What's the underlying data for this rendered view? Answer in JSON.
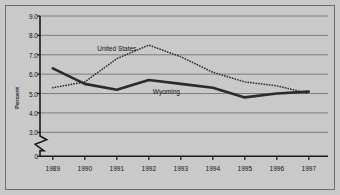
{
  "chart_data": {
    "type": "line",
    "title": "",
    "subtitle": "",
    "xlabel": "",
    "ylabel": "Percent",
    "x": [
      1989,
      1990,
      1991,
      1992,
      1993,
      1994,
      1995,
      1996,
      1997
    ],
    "xtick_labels": [
      "1989",
      "1990",
      "1991",
      "1992",
      "1993",
      "1994",
      "1995",
      "1996",
      "1997"
    ],
    "ytick_labels": [
      "9.0",
      "8.0",
      "7.0",
      "6.0",
      "5.0",
      "4.0",
      "3.0",
      "0"
    ],
    "ytick_values": [
      9.0,
      8.0,
      7.0,
      6.0,
      5.0,
      4.0,
      3.0,
      0
    ],
    "ylim": [
      3.0,
      9.0
    ],
    "xlim": [
      1988.6,
      1997.6
    ],
    "axis_break": true,
    "axis_break_note": "zigzag break on y-axis between 3.0 and 0",
    "grid": true,
    "grid_axis": "y",
    "legend": "inline-labels",
    "series": [
      {
        "name": "United States",
        "style": "dotted",
        "color": "#2b2b2b",
        "values": [
          5.3,
          5.6,
          6.8,
          7.5,
          6.9,
          6.1,
          5.6,
          5.4,
          5.0
        ],
        "label_x": 1991.0,
        "label_y": 7.35
      },
      {
        "name": "Wyoming",
        "style": "solid",
        "color": "#2b2b2b",
        "values": [
          6.3,
          5.5,
          5.2,
          5.7,
          5.5,
          5.3,
          4.8,
          5.0,
          5.1
        ],
        "label_x": 1992.55,
        "label_y": 5.12
      }
    ]
  },
  "figure": {
    "background_color": "#c9c9c9",
    "border_color": "#6e6e6e",
    "axis_color": "#1a1a1a",
    "gridline_color": "#7d7d7d"
  }
}
